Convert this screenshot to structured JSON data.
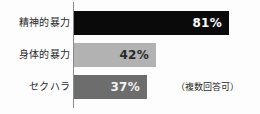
{
  "chart_data": {
    "type": "bar",
    "orientation": "horizontal",
    "title": "",
    "xlabel": "",
    "ylabel": "",
    "categories": [
      "精神的暴力",
      "身体的暴力",
      "セクハラ"
    ],
    "values": [
      81,
      42,
      37
    ],
    "value_labels": [
      "81%",
      "42%",
      "37%"
    ],
    "unit": "%",
    "xlim": [
      0,
      100
    ],
    "grid": false,
    "legend": false,
    "bar_colors": [
      "#0a0a0a",
      "#b2b2b2",
      "#6d6d6d"
    ],
    "value_label_colors": [
      "#ffffff",
      "#2a2a2a",
      "#f2f2f2"
    ],
    "annotations": [
      "（複数回答可）"
    ]
  },
  "chart": {
    "axis_color": "#8a8a8a",
    "background": "#fdfdfd",
    "footnote": "（複数回答可）",
    "rows": [
      {
        "label": "精神的暴力",
        "value_label": "81%"
      },
      {
        "label": "身体的暴力",
        "value_label": "42%"
      },
      {
        "label": "セクハラ",
        "value_label": "37%"
      }
    ]
  }
}
